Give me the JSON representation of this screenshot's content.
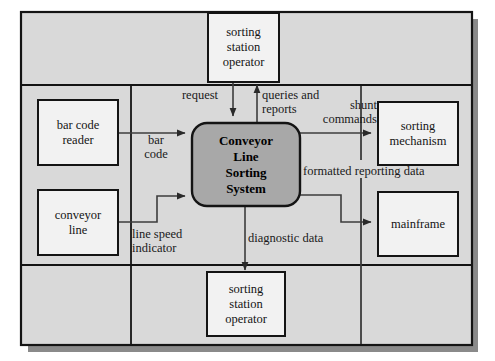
{
  "diagram": {
    "type": "context-data-flow-diagram",
    "colors": {
      "frame_fill": "#d9d9d9",
      "frame_border": "#141414",
      "shadow": "#7a7a7a",
      "entity_fill": "#f2f2f2",
      "entity_border": "#141414",
      "process_fill": "#a8a8a8",
      "process_border": "#141414",
      "line": "#3c3c3c",
      "text": "#141414"
    },
    "process": {
      "name": "conveyor-line-sorting-system",
      "lines": [
        "Conveyor",
        "Line",
        "Sorting",
        "System"
      ]
    },
    "entities": [
      {
        "name": "sorting-station-operator-top",
        "lines": [
          "sorting",
          "station",
          "operator"
        ]
      },
      {
        "name": "bar-code-reader",
        "lines": [
          "bar code",
          "reader"
        ]
      },
      {
        "name": "conveyor-line",
        "lines": [
          "conveyor",
          "line"
        ]
      },
      {
        "name": "sorting-mechanism",
        "lines": [
          "sorting",
          "mechanism"
        ]
      },
      {
        "name": "mainframe",
        "lines": [
          "mainframe"
        ]
      },
      {
        "name": "sorting-station-operator-bottom",
        "lines": [
          "sorting",
          "station",
          "operator"
        ]
      }
    ],
    "flows": [
      {
        "name": "request",
        "lines": [
          "request"
        ],
        "from": "sorting-station-operator-top",
        "to": "conveyor-line-sorting-system"
      },
      {
        "name": "queries-and-reports",
        "lines": [
          "queries and",
          "reports"
        ],
        "from": "conveyor-line-sorting-system",
        "to": "sorting-station-operator-top"
      },
      {
        "name": "bar-code",
        "lines": [
          "bar",
          "code"
        ],
        "from": "bar-code-reader",
        "to": "conveyor-line-sorting-system"
      },
      {
        "name": "line-speed-indicator",
        "lines": [
          "line speed",
          "indicator"
        ],
        "from": "conveyor-line",
        "to": "conveyor-line-sorting-system"
      },
      {
        "name": "shunt-commands",
        "lines": [
          "shunt",
          "commands"
        ],
        "from": "conveyor-line-sorting-system",
        "to": "sorting-mechanism"
      },
      {
        "name": "formatted-reporting-data",
        "lines": [
          "formatted reporting data"
        ],
        "from": "conveyor-line-sorting-system",
        "to": "mainframe"
      },
      {
        "name": "diagnostic-data",
        "lines": [
          "diagnostic data"
        ],
        "from": "conveyor-line-sorting-system",
        "to": "sorting-station-operator-bottom"
      }
    ]
  }
}
